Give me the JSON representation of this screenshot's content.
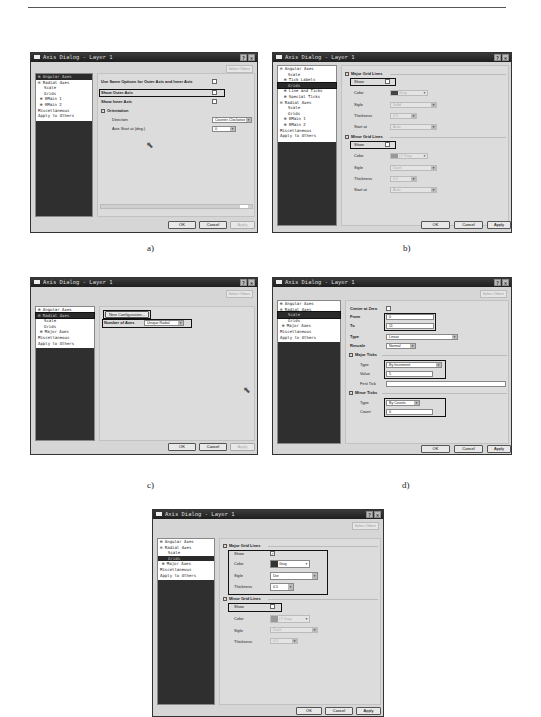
{
  "page_header": {
    "text": "· · · · · · · ·",
    "page": ""
  },
  "common": {
    "dialog_title": "Axis Dialog - Layer 1",
    "help_btn": "?",
    "close_btn": "×",
    "select_others": "Select Others",
    "ok": "OK",
    "cancel": "Cancel",
    "apply": "Apply"
  },
  "captions": {
    "a": "a)",
    "b": "b)",
    "c": "c)",
    "d": "d)"
  },
  "panel_a": {
    "tree": [
      "⊞ Angular Axes",
      "⊟ Radial Axes",
      "Scale",
      "Grids",
      "⊞ θMain 1",
      "⊞ θMain 2",
      "Miscellaneous",
      "Apply to Others"
    ],
    "same_options": "Use Same Options for Outer Axis and Inner Axis",
    "show_outer": "Show Outer Axis",
    "show_inner": "Show Inner Axis",
    "orientation": "Orientation",
    "direction_label": "Direction",
    "direction_value": "Counter-Clockwise",
    "start_label": "Axis Start at (deg.)",
    "start_value": "0"
  },
  "panel_b": {
    "tree": [
      "⊟ Angular Axes",
      "Scale",
      "⊞ Tick Labels",
      "Grids",
      "⊞ Line and Ticks",
      "⊞ Special Ticks",
      "⊟ Radial Axes",
      "Scale",
      "Grids",
      "⊞ θMain 1",
      "⊞ θMain 2",
      "Miscellaneous",
      "Apply to Others"
    ],
    "major_title": "Major Grid Lines",
    "minor_title": "Minor Grid Lines",
    "show": "Show",
    "color": "Color",
    "style": "Style",
    "thickness": "Thickness",
    "start_at": "Start at",
    "major_color": "Gray",
    "major_style": "Solid",
    "major_thickness": "0.5",
    "major_start": "Auto",
    "minor_color": "LT Gray",
    "minor_style": "Dash",
    "minor_thickness": "0.5",
    "minor_start": "Auto"
  },
  "panel_c": {
    "tree": [
      "⊞ Angular Axes",
      "⊟ Radial Axes",
      "Scale",
      "Grids",
      "⊞ Major Axes",
      "Miscellaneous",
      "Apply to Others"
    ],
    "new_config": "New Configuration...",
    "num_axes_label": "Number of Axes",
    "num_axes_value": "Unique Radial"
  },
  "panel_d": {
    "tree": [
      "⊞ Angular Axes",
      "⊟ Radial Axes",
      "Scale",
      "Grids",
      "⊞ Major Axes",
      "Miscellaneous",
      "Apply to Others"
    ],
    "center_zero": "Center at Zero",
    "from_label": "From",
    "from_value": "0",
    "to_label": "To",
    "to_value": "11",
    "type_label": "Type",
    "type_value": "Linear",
    "rescale_label": "Rescale",
    "rescale_value": "Normal",
    "major_ticks": "Major Ticks",
    "major_type_label": "Type",
    "major_type_value": "By Increment",
    "value_label": "Value",
    "value_value": "5",
    "first_tick_label": "First Tick",
    "first_tick_value": "",
    "minor_ticks": "Minor Ticks",
    "minor_type_label": "Type",
    "minor_type_value": "By Counts",
    "count_label": "Count",
    "count_value": "0"
  },
  "panel_e": {
    "tree": [
      "⊞ Angular Axes",
      "⊟ Radial Axes",
      "Scale",
      "Grids",
      "⊞ Major Axes",
      "Miscellaneous",
      "Apply to Others"
    ],
    "major_title": "Major Grid Lines",
    "minor_title": "Minor Grid Lines",
    "show": "Show",
    "color": "Color",
    "style": "Style",
    "thickness": "Thickness",
    "major_show": "✓",
    "major_color": "Gray",
    "major_style": "Dot",
    "major_thickness": "0.5",
    "minor_color": "LT Gray",
    "minor_style": "Dash",
    "minor_thickness": "0.5"
  }
}
